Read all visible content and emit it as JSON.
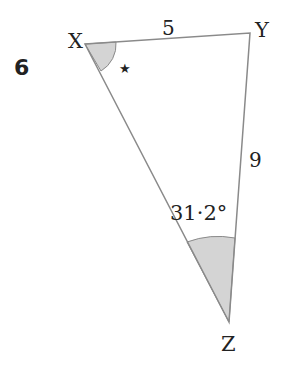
{
  "question_number": "6",
  "triangle": {
    "vertices": {
      "X": {
        "label": "X",
        "x": 85,
        "y": 44
      },
      "Y": {
        "label": "Y",
        "x": 250,
        "y": 33
      },
      "Z": {
        "label": "Z",
        "x": 229,
        "y": 322
      }
    },
    "sides": {
      "XY": {
        "label": "5"
      },
      "YZ": {
        "label": "9"
      }
    },
    "angles": {
      "X": {
        "label": "★",
        "meaning": "unknown angle",
        "shaded": true
      },
      "Z": {
        "label": "31·2°",
        "shaded": true
      }
    }
  },
  "colors": {
    "line": "#8a8a8a",
    "shade": "#d4d4d4",
    "text": "#222222"
  }
}
